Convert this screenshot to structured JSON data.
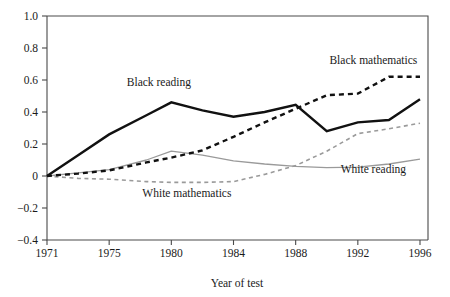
{
  "chart_data": {
    "type": "line",
    "title": "",
    "xlabel": "Year of test",
    "ylabel": "",
    "x": [
      1971,
      1973,
      1975,
      1978,
      1980,
      1982,
      1984,
      1986,
      1988,
      1990,
      1992,
      1994,
      1996
    ],
    "xtick_labels": [
      "1971",
      "1975",
      "1980",
      "1984",
      "1988",
      "1992",
      "1996"
    ],
    "xtick_values": [
      1971,
      1975,
      1980,
      1984,
      1988,
      1992,
      1996
    ],
    "ytick_labels": [
      "1.0",
      "0.8",
      "0.6",
      "0.4",
      "0.2",
      "0",
      "−0.2",
      "−0.4"
    ],
    "ytick_values": [
      1.0,
      0.8,
      0.6,
      0.4,
      0.2,
      0,
      -0.2,
      -0.4
    ],
    "ylim": [
      -0.4,
      1.0
    ],
    "grid": false,
    "legend_position": "inline-annotations",
    "series": [
      {
        "name": "Black reading",
        "style": "solid",
        "color": "#111111",
        "weight": "thick",
        "label_x": 1979,
        "label_y": 0.56,
        "values": [
          0.0,
          0.13,
          0.26,
          0.38,
          0.46,
          0.41,
          0.37,
          0.4,
          0.445,
          0.28,
          0.335,
          0.35,
          0.48
        ]
      },
      {
        "name": "Black mathematics",
        "style": "dashed",
        "color": "#111111",
        "weight": "thick",
        "label_x": 1993,
        "label_y": 0.7,
        "values": [
          0.0,
          0.015,
          0.035,
          0.085,
          0.115,
          0.16,
          0.245,
          0.335,
          0.42,
          0.505,
          0.515,
          0.62,
          0.62
        ]
      },
      {
        "name": "White reading",
        "style": "solid",
        "color": "#9a9a9a",
        "weight": "thin",
        "label_x": 1993,
        "label_y": 0.02,
        "values": [
          0.0,
          0.02,
          0.04,
          0.1,
          0.155,
          0.13,
          0.095,
          0.075,
          0.06,
          0.052,
          0.055,
          0.075,
          0.105
        ]
      },
      {
        "name": "White mathematics",
        "style": "dashed",
        "color": "#9a9a9a",
        "weight": "thin",
        "label_x": 1981,
        "label_y": -0.13,
        "values": [
          0.0,
          -0.015,
          -0.02,
          -0.035,
          -0.04,
          -0.04,
          -0.035,
          0.01,
          0.065,
          0.155,
          0.265,
          0.295,
          0.33
        ]
      }
    ],
    "annotations": [
      {
        "text": "Black reading"
      },
      {
        "text": "Black mathematics"
      },
      {
        "text": "White reading"
      },
      {
        "text": "White mathematics"
      }
    ]
  },
  "axis": {
    "x_title": "Year of test"
  },
  "colors": {
    "black_series": "#111111",
    "white_series": "#9a9a9a",
    "axis": "#4a4a4a",
    "background": "#ffffff"
  }
}
